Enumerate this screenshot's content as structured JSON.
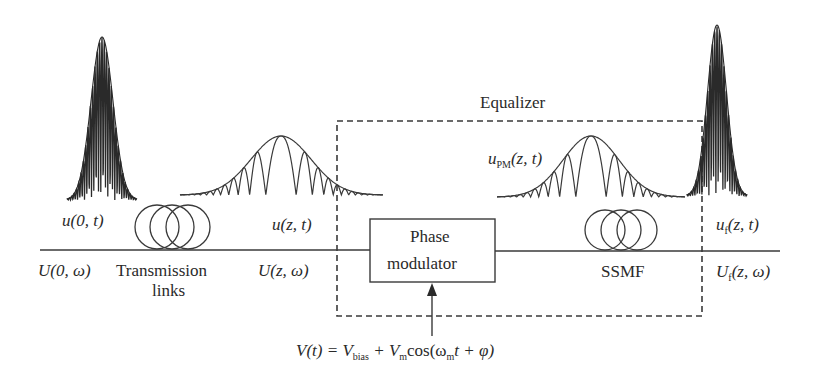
{
  "figure": {
    "colors": {
      "stroke": "#3a3a3a",
      "background": "#ffffff"
    }
  },
  "labels": {
    "u0t": "u(0, t)",
    "U0w": "U(0, ω)",
    "transmission_line1": "Transmission",
    "transmission_line2": "links",
    "uzt": "u(z, t)",
    "Uzw": "U(z, ω)",
    "equalizer": "Equalizer",
    "upm_main": "u",
    "upm_sub": "PM",
    "upm_args": "(z, t)",
    "phase_mod_line1": "Phase",
    "phase_mod_line2": "modulator",
    "ssmf": "SSMF",
    "uf_main": "u",
    "uf_sub": "f",
    "uf_args": "(z, t)",
    "Uf_main": "U",
    "Uf_sub": "f",
    "Uf_args": "(z, ω)"
  },
  "drive_signal": {
    "V": "V(t) = V",
    "bias_sub": "bias",
    "plus": " + V",
    "m_sub": "m",
    "cos": "cos(ω",
    "m_sub2": "m",
    "tail": "t + φ)"
  },
  "components": [
    {
      "name": "input-pulse",
      "kind": "chirp-free short pulse"
    },
    {
      "name": "transmission-links",
      "kind": "fiber coil"
    },
    {
      "name": "dispersed-pulse",
      "kind": "broadened chirped pulse"
    },
    {
      "name": "phase-modulator",
      "kind": "block"
    },
    {
      "name": "modulated-pulse",
      "kind": "chirped pulse"
    },
    {
      "name": "ssmf",
      "kind": "fiber coil"
    },
    {
      "name": "output-pulse",
      "kind": "recompressed short pulse"
    }
  ]
}
